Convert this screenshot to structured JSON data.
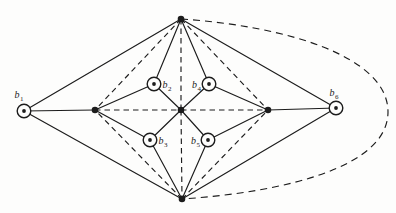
{
  "figure": {
    "width": 396,
    "height": 213,
    "background_color": "#fdfdfc",
    "ink_color": "#1c1c1c",
    "style": {
      "edge_stroke_width": 1.15,
      "dash_pattern": "5.5 4",
      "arc_dash_pattern": "7 5",
      "dot_radius": 3.3,
      "circled_outer_radius": 6.8,
      "circled_outer_stroke": 1.4,
      "circled_inner_dot_radius": 1.9,
      "label_font_size": 10,
      "subscript_font_size": 7
    }
  },
  "graph": {
    "nodes": [
      {
        "id": "top",
        "x": 181,
        "y": 19,
        "kind": "dot"
      },
      {
        "id": "bottom",
        "x": 182,
        "y": 199,
        "kind": "dot"
      },
      {
        "id": "left-hub",
        "x": 95,
        "y": 110,
        "kind": "dot"
      },
      {
        "id": "right-hub",
        "x": 268,
        "y": 110,
        "kind": "dot"
      },
      {
        "id": "center",
        "x": 181,
        "y": 110,
        "kind": "dot"
      },
      {
        "id": "b1",
        "x": 24,
        "y": 111,
        "kind": "circled",
        "label": "b",
        "sub": "1",
        "label_x": 19,
        "label_y": 98
      },
      {
        "id": "b2",
        "x": 154,
        "y": 84,
        "kind": "circled",
        "label": "b",
        "sub": "2",
        "label_x": 167,
        "label_y": 88
      },
      {
        "id": "b3",
        "x": 150,
        "y": 140,
        "kind": "circled",
        "label": "b",
        "sub": "3",
        "label_x": 163,
        "label_y": 144
      },
      {
        "id": "b4",
        "x": 209,
        "y": 84,
        "kind": "circled",
        "label": "b",
        "sub": "4",
        "label_x": 196.5,
        "label_y": 88
      },
      {
        "id": "b5",
        "x": 208,
        "y": 140,
        "kind": "circled",
        "label": "b",
        "sub": "5",
        "label_x": 195.5,
        "label_y": 144
      },
      {
        "id": "b6",
        "x": 336,
        "y": 108,
        "kind": "circled",
        "label": "b",
        "sub": "6",
        "label_x": 334,
        "label_y": 96
      }
    ],
    "edges": [
      {
        "from": "b1",
        "to": "top",
        "style": "solid"
      },
      {
        "from": "b1",
        "to": "bottom",
        "style": "solid"
      },
      {
        "from": "b1",
        "to": "left-hub",
        "style": "solid"
      },
      {
        "from": "top",
        "to": "b2",
        "style": "solid"
      },
      {
        "from": "top",
        "to": "b4",
        "style": "solid"
      },
      {
        "from": "top",
        "to": "b6",
        "style": "solid"
      },
      {
        "from": "bottom",
        "to": "b3",
        "style": "solid"
      },
      {
        "from": "bottom",
        "to": "b5",
        "style": "solid"
      },
      {
        "from": "bottom",
        "to": "b6",
        "style": "solid"
      },
      {
        "from": "left-hub",
        "to": "b2",
        "style": "solid"
      },
      {
        "from": "left-hub",
        "to": "b3",
        "style": "solid"
      },
      {
        "from": "right-hub",
        "to": "b4",
        "style": "solid"
      },
      {
        "from": "right-hub",
        "to": "b5",
        "style": "solid"
      },
      {
        "from": "right-hub",
        "to": "b6",
        "style": "solid"
      },
      {
        "from": "center",
        "to": "b2",
        "style": "solid"
      },
      {
        "from": "center",
        "to": "b3",
        "style": "solid"
      },
      {
        "from": "center",
        "to": "b4",
        "style": "solid"
      },
      {
        "from": "center",
        "to": "b5",
        "style": "solid"
      },
      {
        "from": "top",
        "to": "left-hub",
        "style": "dashed"
      },
      {
        "from": "top",
        "to": "right-hub",
        "style": "dashed"
      },
      {
        "from": "bottom",
        "to": "left-hub",
        "style": "dashed"
      },
      {
        "from": "bottom",
        "to": "right-hub",
        "style": "dashed"
      },
      {
        "from": "top",
        "to": "center",
        "style": "dashed"
      },
      {
        "from": "center",
        "to": "bottom",
        "style": "dashed"
      },
      {
        "from": "left-hub",
        "to": "center",
        "style": "dashed"
      },
      {
        "from": "center",
        "to": "right-hub",
        "style": "dashed"
      }
    ],
    "curves": [
      {
        "id": "outer-dashed-arc-top-bottom",
        "style": "dashed",
        "path": "M 181 19 C 285 26, 388 56, 388 112 C 388 167, 285 192, 182 199"
      }
    ]
  }
}
